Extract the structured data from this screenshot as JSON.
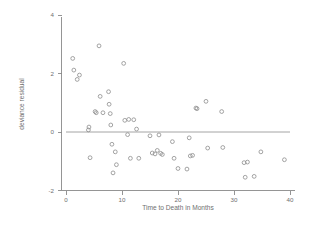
{
  "chart_data": {
    "type": "scatter",
    "title": "",
    "xlabel": "Time to Death in Months",
    "ylabel": "deviance residual",
    "xlim": [
      -1,
      41
    ],
    "ylim": [
      -2.3,
      4.2
    ],
    "xticks": [
      0,
      10,
      20,
      30,
      40
    ],
    "yticks": [
      -2,
      0,
      2,
      4
    ],
    "xtick_labels": [
      "0",
      "10",
      "20",
      "30",
      "40"
    ],
    "ytick_labels": [
      "-2",
      "0",
      "2",
      "4"
    ],
    "grid": false,
    "legend": "none",
    "marker": "open-circle",
    "marker_color": "#8d8d8d",
    "reference_line": {
      "type": "horizontal",
      "y": 0,
      "x_start": 0,
      "x_end": 40,
      "color": "#9a9a9a"
    },
    "x": [
      1.2,
      1.4,
      2.0,
      2.4,
      4.0,
      4.1,
      4.3,
      5.2,
      5.4,
      5.9,
      6.1,
      6.6,
      7.6,
      7.7,
      7.9,
      8.0,
      8.2,
      8.4,
      8.8,
      9.0,
      10.3,
      10.5,
      11.0,
      11.2,
      11.5,
      12.1,
      12.6,
      13.0,
      15.0,
      15.4,
      15.9,
      16.3,
      16.6,
      16.9,
      17.2,
      19.0,
      19.3,
      20.0,
      21.6,
      22.0,
      22.2,
      22.6,
      23.2,
      23.4,
      25.0,
      25.3,
      27.8,
      28.0,
      31.8,
      32.0,
      32.4,
      33.6,
      34.8,
      39.0
    ],
    "y": [
      2.52,
      2.12,
      1.8,
      1.95,
      0.07,
      0.17,
      -0.88,
      0.7,
      0.66,
      2.95,
      1.22,
      0.66,
      1.38,
      0.95,
      0.63,
      0.24,
      -0.42,
      -1.4,
      -0.68,
      -1.12,
      2.35,
      0.4,
      -0.09,
      0.43,
      -0.9,
      0.42,
      0.1,
      -0.9,
      -0.13,
      -0.72,
      -0.75,
      -0.63,
      -0.1,
      -0.73,
      -0.77,
      -0.33,
      -0.9,
      -1.25,
      -1.27,
      -0.2,
      -0.82,
      -0.8,
      0.82,
      0.8,
      1.05,
      -0.55,
      0.7,
      -0.53,
      -1.05,
      -1.55,
      -1.03,
      -1.52,
      -0.68,
      -0.95
    ],
    "n_points": 54
  }
}
